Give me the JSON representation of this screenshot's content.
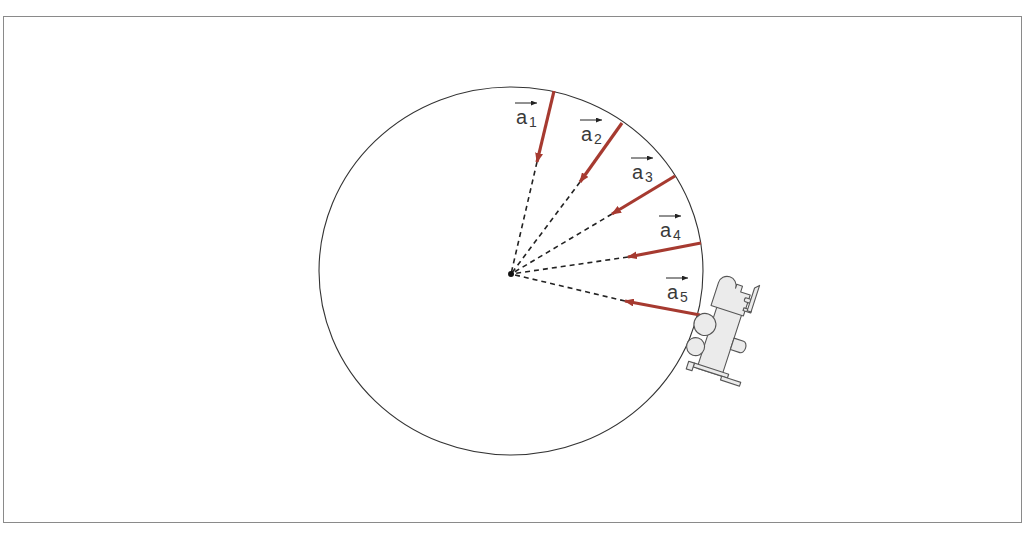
{
  "diagram": {
    "colors": {
      "vector": "#a63a30",
      "circle": "#333333",
      "dashed": "#222222",
      "label": "#3a3a3a",
      "train_fill": "#ebebeb",
      "train_stroke": "#555555",
      "frame": "#8a8a8a"
    },
    "circle": {
      "cx": 511,
      "cy": 271,
      "rx": 192,
      "ry": 184
    },
    "center_point": {
      "x": 511,
      "y": 274
    },
    "vectors": [
      {
        "id": "a1",
        "symbol": "a",
        "subscript": "1",
        "start": [
          554,
          91
        ],
        "end": [
          537,
          162
        ],
        "label_x": 516,
        "label_y": 124
      },
      {
        "id": "a2",
        "symbol": "a",
        "subscript": "2",
        "start": [
          622,
          123
        ],
        "end": [
          580,
          182
        ],
        "label_x": 581,
        "label_y": 141
      },
      {
        "id": "a3",
        "symbol": "a",
        "subscript": "3",
        "start": [
          675,
          176
        ],
        "end": [
          612,
          214
        ],
        "label_x": 632,
        "label_y": 179
      },
      {
        "id": "a4",
        "symbol": "a",
        "subscript": "4",
        "start": [
          701,
          243
        ],
        "end": [
          628,
          257
        ],
        "label_x": 660,
        "label_y": 237
      },
      {
        "id": "a5",
        "symbol": "a",
        "subscript": "5",
        "start": [
          700,
          315
        ],
        "end": [
          625,
          301
        ],
        "label_x": 667,
        "label_y": 299
      }
    ],
    "object": {
      "name": "locomotive (top view)",
      "x": 722,
      "y": 330,
      "rotation": 18
    }
  }
}
